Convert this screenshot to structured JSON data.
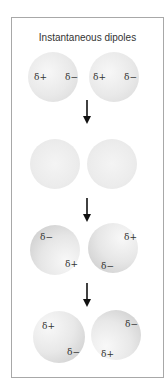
{
  "diagram": {
    "title": "Instantaneous dipoles",
    "stages": [
      {
        "name": "stage-1",
        "spheres": [
          {
            "labels": [
              {
                "text": "δ+",
                "pos": "left"
              },
              {
                "text": "δ−",
                "pos": "right"
              }
            ]
          },
          {
            "labels": [
              {
                "text": "δ+",
                "pos": "left"
              },
              {
                "text": "δ−",
                "pos": "right"
              }
            ]
          }
        ]
      },
      {
        "name": "stage-2",
        "spheres": [
          {
            "labels": []
          },
          {
            "labels": []
          }
        ]
      },
      {
        "name": "stage-3",
        "spheres": [
          {
            "labels": [
              {
                "text": "δ−",
                "pos": "top-left"
              },
              {
                "text": "δ+",
                "pos": "bottom-right"
              }
            ]
          },
          {
            "labels": [
              {
                "text": "δ+",
                "pos": "top-right"
              },
              {
                "text": "δ−",
                "pos": "bottom-left"
              }
            ]
          }
        ]
      },
      {
        "name": "stage-4",
        "spheres": [
          {
            "labels": [
              {
                "text": "δ+",
                "pos": "top-left"
              },
              {
                "text": "δ−",
                "pos": "bottom-right"
              }
            ]
          },
          {
            "labels": [
              {
                "text": "δ−",
                "pos": "top-right"
              },
              {
                "text": "δ+",
                "pos": "bottom-left"
              }
            ]
          }
        ]
      }
    ],
    "arrows": [
      "down-arrow",
      "down-arrow",
      "down-arrow"
    ],
    "colors": {
      "frame_border": "#a8a8a8",
      "text": "#333333",
      "arrow": "#111111",
      "sphere_light": "#f4f4f4",
      "sphere_shade": "#c6c6c6"
    }
  }
}
